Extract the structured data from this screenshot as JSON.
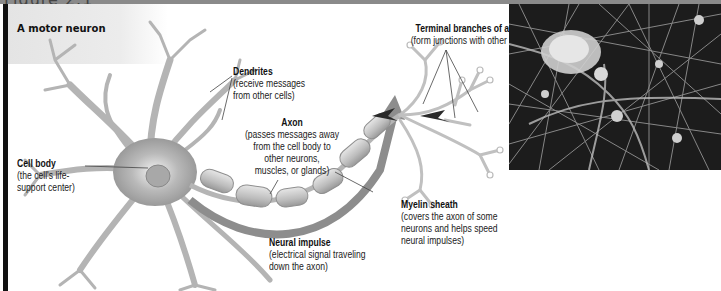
{
  "figure": {
    "heading": "Figure 2.1",
    "panel_title": "A motor neuron"
  },
  "labels": {
    "dendrites": {
      "title": "Dendrites",
      "lines": [
        "(receive messages",
        "from other cells)"
      ]
    },
    "axon": {
      "title": "Axon",
      "lines": [
        "(passes messages away",
        "from the cell body to",
        "other neurons,",
        "muscles, or glands)"
      ]
    },
    "cell_body": {
      "title": "Cell body",
      "lines": [
        "(the cell's life-",
        "support center)"
      ]
    },
    "terminal_branches": {
      "title": "Terminal branches of axon",
      "lines": [
        "(form junctions with other cells)"
      ]
    },
    "myelin_sheath": {
      "title": "Myelin sheath",
      "lines": [
        "(covers the axon of some",
        "neurons and helps speed",
        "neural impulses)"
      ]
    },
    "neural_impulse": {
      "title": "Neural impulse",
      "lines": [
        "(electrical signal traveling",
        "down the axon)"
      ]
    }
  },
  "photo": {
    "subject": "micrograph-of-neuron-network"
  },
  "colors": {
    "left_bar": "#111111",
    "top_bar": "#8a8a8a",
    "panel_bg": "#e6e6e6",
    "impulse_arrow": "#8a8a8a",
    "arrow_dark": "#2a2a2a"
  }
}
